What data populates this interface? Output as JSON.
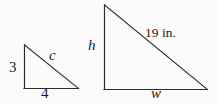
{
  "figure": {
    "type": "similar-right-triangles-diagram",
    "background_color": "#fbfbfb",
    "stroke_color": "#2b2b2b",
    "text_color": "#1d1d1d",
    "small_triangle": {
      "name": "small right triangle",
      "vertices": {
        "top": [
          24,
          45
        ],
        "bottom_left": [
          24,
          88
        ],
        "bottom_right": [
          78,
          88
        ]
      },
      "labels": {
        "vertical_leg": "3",
        "horizontal_leg": "4",
        "hypotenuse": "c"
      }
    },
    "large_triangle": {
      "name": "large right triangle",
      "vertices": {
        "top": [
          104,
          5
        ],
        "bottom_left": [
          104,
          89
        ],
        "bottom_right": [
          207,
          89
        ]
      },
      "labels": {
        "vertical_leg": "h",
        "horizontal_leg": "w",
        "hypotenuse": "19 in."
      }
    }
  }
}
